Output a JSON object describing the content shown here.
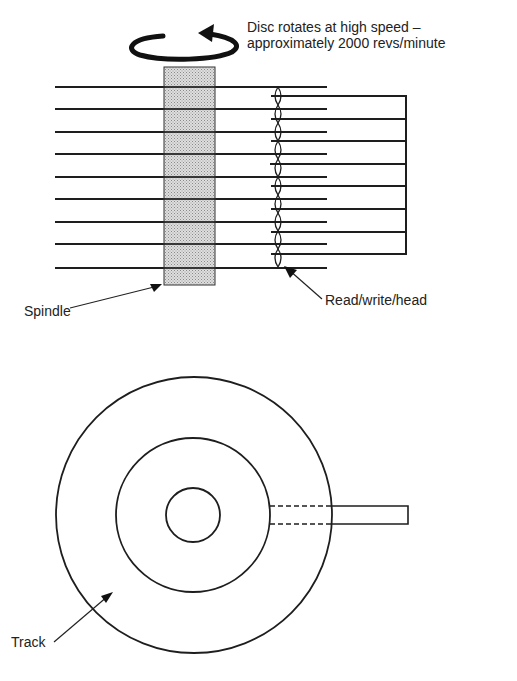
{
  "figure": {
    "top_view_caption": {
      "line1": "Disc rotates at high speed –",
      "line2": "approximately 2000 revs/minute"
    },
    "labels": {
      "spindle": "Spindle",
      "read_write_head": "Read/write/head",
      "track": "Track"
    },
    "side_view": {
      "disc_count": 9,
      "arm_count": 8,
      "rotation_icon": "circular-arrow-icon"
    },
    "plan_view": {
      "circles": [
        "outer-disc-edge",
        "track",
        "spindle-hole"
      ],
      "arm": "read-write-arm"
    },
    "colors": {
      "ink": "#1e1e1e",
      "spindle_fill": "#c8c8c8",
      "background": "#ffffff"
    }
  }
}
